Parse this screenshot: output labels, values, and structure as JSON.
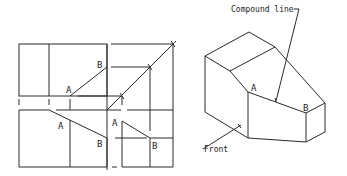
{
  "diagram": {
    "orthographic": {
      "top_view": {
        "label_a": "A",
        "label_b": "B"
      },
      "front_view": {
        "label_a": "A",
        "label_b": "B"
      },
      "side_view": {
        "label_a": "A",
        "label_b": "B"
      }
    },
    "isometric": {
      "label_a": "A",
      "label_b": "B",
      "callout_compound_line": "Compound line",
      "callout_front": "Front"
    },
    "colors": {
      "line": "#2a2a2a",
      "background": "#ffffff"
    }
  }
}
